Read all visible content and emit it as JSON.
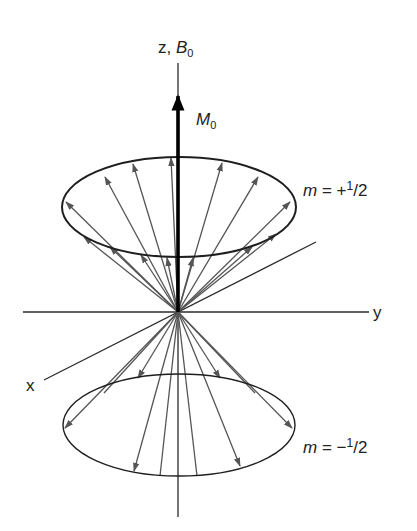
{
  "figure": {
    "type": "spin-precession-cones",
    "colors": {
      "axis": "#2a2a2a",
      "ellipse": "#1e1e1e",
      "vector": "#555555",
      "magnetization": "#000000",
      "text": "#222222"
    },
    "axes": {
      "z_label": "z, ",
      "z_field_symbol": "B",
      "z_field_subscript": "0",
      "y_label": "y",
      "x_label": "x"
    },
    "net_magnetization": {
      "symbol": "M",
      "subscript": "0"
    },
    "upper_cone": {
      "label_var": "m",
      "label_eq": " = +",
      "label_num": "1",
      "label_slash": "/",
      "label_den": "2"
    },
    "lower_cone": {
      "label_var": "m",
      "label_eq": " = −",
      "label_num": "1",
      "label_slash": "/",
      "label_den": "2"
    }
  }
}
